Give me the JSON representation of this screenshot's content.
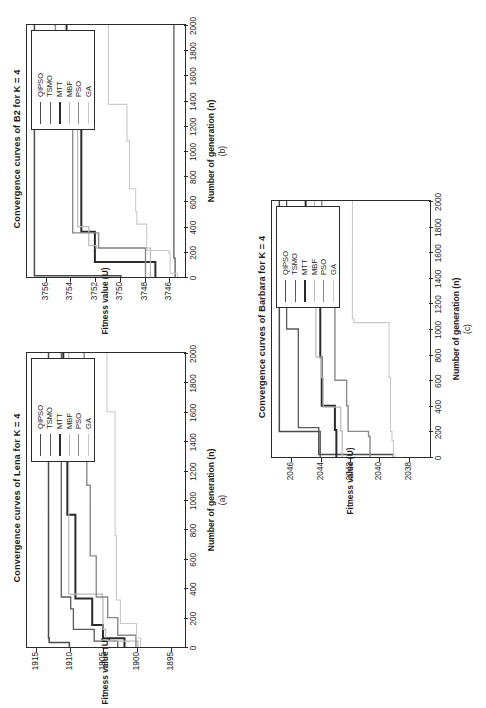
{
  "figure": {
    "orientation_deg": 90,
    "axis_x_label": "Number of generation (n)",
    "axis_y_label": "Fitness value (U)",
    "legend_entries": [
      "QIPSO",
      "TSMO",
      "MTT",
      "MBF",
      "PSO",
      "GA"
    ],
    "series_colors": {
      "QIPSO": "#4a4a4a",
      "TSMO": "#5a5a5a",
      "MTT": "#2b2b2b",
      "MBF": "#b9b9b9",
      "PSO": "#8a8a8a",
      "GA": "#c9c9c9"
    }
  },
  "panels": [
    {
      "id": "a",
      "letter": "(a)",
      "title": "Convergence curves of Lena for K = 4"
    },
    {
      "id": "b",
      "letter": "(b)",
      "title": "Convergence curves of B2 for K = 4"
    },
    {
      "id": "c",
      "letter": "(c)",
      "title": "Convergence curves of Barbara for K = 4"
    }
  ],
  "chart_data": [
    {
      "panel": "a",
      "type": "line",
      "title": "Convergence curves of Lena for K = 4",
      "xlabel": "Number of generation (n)",
      "ylabel": "Fitness value (U)",
      "xlim": [
        0,
        2000
      ],
      "ylim": [
        1893,
        1916.5
      ],
      "xticks": [
        0,
        200,
        400,
        600,
        800,
        1000,
        1200,
        1400,
        1600,
        1800,
        2000
      ],
      "yticks": [
        1915,
        1910,
        1905,
        1900,
        1895
      ],
      "grid": false,
      "legend_position": "upper-right",
      "series": [
        {
          "name": "QIPSO",
          "x": [
            0,
            30,
            60,
            2000
          ],
          "y": [
            1910.2,
            1913.2,
            1913.3,
            1913.3
          ]
        },
        {
          "name": "TSMO",
          "x": [
            0,
            40,
            120,
            260,
            340,
            2000
          ],
          "y": [
            1903.0,
            1906.5,
            1909.6,
            1910.0,
            1911.4,
            1911.4
          ]
        },
        {
          "name": "MTT",
          "x": [
            0,
            60,
            150,
            330,
            900,
            1400,
            2000
          ],
          "y": [
            1902.0,
            1905.2,
            1906.8,
            1909.3,
            1910.5,
            1911.1,
            1911.2
          ]
        },
        {
          "name": "MBF",
          "x": [
            0,
            40,
            120,
            330,
            360,
            2000
          ],
          "y": [
            1900.0,
            1904.8,
            1905.2,
            1905.3,
            1910.3,
            1910.4
          ]
        },
        {
          "name": "PSO",
          "x": [
            0,
            80,
            200,
            340,
            620,
            1100,
            1550,
            2000
          ],
          "y": [
            1900.3,
            1903.0,
            1904.5,
            1906.2,
            1907.1,
            1907.6,
            1908.0,
            1908.1
          ]
        },
        {
          "name": "GA",
          "x": [
            0,
            60,
            160,
            320,
            760,
            1600,
            2000
          ],
          "y": [
            1899.6,
            1900.2,
            1902.6,
            1903.2,
            1903.4,
            1904.6,
            1904.7
          ]
        }
      ]
    },
    {
      "panel": "b",
      "type": "line",
      "title": "Convergence curves of B2 for K = 4",
      "xlabel": "Number of generation (n)",
      "ylabel": "Fitness value (U)",
      "xlim": [
        0,
        2000
      ],
      "ylim": [
        3744.8,
        3757.6
      ],
      "xticks": [
        0,
        200,
        400,
        600,
        800,
        1000,
        1200,
        1400,
        1600,
        1800,
        2000
      ],
      "yticks": [
        3756,
        3754,
        3752,
        3750,
        3748,
        3746
      ],
      "grid": false,
      "legend_position": "upper-right",
      "series": [
        {
          "name": "QIPSO",
          "x": [
            0,
            10,
            2000
          ],
          "y": [
            3750.0,
            3757.0,
            3757.0
          ]
        },
        {
          "name": "TSMO",
          "x": [
            0,
            150,
            2000
          ],
          "y": [
            3745.6,
            3745.7,
            3745.7
          ]
        },
        {
          "name": "MTT",
          "x": [
            0,
            120,
            340,
            360,
            1380,
            2000
          ],
          "y": [
            3747.2,
            3752.1,
            3752.1,
            3753.2,
            3754.4,
            3754.4
          ]
        },
        {
          "name": "MBF",
          "x": [
            0,
            190,
            230,
            250,
            400,
            1400,
            2000
          ],
          "y": [
            3747.6,
            3747.6,
            3752.0,
            3752.6,
            3753.5,
            3754.5,
            3754.5
          ]
        },
        {
          "name": "PSO",
          "x": [
            0,
            200,
            230,
            350,
            1190,
            1400,
            2000
          ],
          "y": [
            3748.0,
            3748.0,
            3751.8,
            3753.9,
            3754.0,
            3755.3,
            3755.4
          ]
        },
        {
          "name": "GA",
          "x": [
            0,
            30,
            190,
            210,
            400,
            420,
            520,
            700,
            1080,
            1370,
            2000
          ],
          "y": [
            3745.4,
            3746.0,
            3746.1,
            3747.9,
            3747.9,
            3748.7,
            3748.8,
            3749.3,
            3749.5,
            3751.0,
            3751.0
          ]
        }
      ]
    },
    {
      "panel": "c",
      "type": "line",
      "title": "Convergence curves of Barbara for K = 4",
      "xlabel": "Number of generation (n)",
      "ylabel": "Fitness value (U)",
      "xlim": [
        0,
        2000
      ],
      "ylim": [
        2036.6,
        2047.4
      ],
      "xticks": [
        0,
        200,
        400,
        600,
        800,
        1000,
        1200,
        1400,
        1600,
        1800,
        2000
      ],
      "yticks": [
        2046,
        2044,
        2042,
        2040,
        2038
      ],
      "grid": false,
      "legend_position": "upper-right",
      "series": [
        {
          "name": "QIPSO",
          "x": [
            0,
            20,
            200,
            2000
          ],
          "y": [
            2039.1,
            2044.2,
            2046.9,
            2046.9
          ]
        },
        {
          "name": "TSMO",
          "x": [
            0,
            200,
            230,
            1000,
            2000
          ],
          "y": [
            2044.1,
            2044.2,
            2045.6,
            2046.4,
            2046.4
          ]
        },
        {
          "name": "MTT",
          "x": [
            0,
            210,
            400,
            780,
            1200,
            2000
          ],
          "y": [
            2043.0,
            2043.1,
            2044.0,
            2044.1,
            2045.1,
            2045.1
          ]
        },
        {
          "name": "MBF",
          "x": [
            0,
            200,
            390,
            620,
            780,
            1220,
            2000
          ],
          "y": [
            2042.6,
            2042.7,
            2043.9,
            2044.0,
            2044.4,
            2044.5,
            2044.5
          ]
        },
        {
          "name": "PSO",
          "x": [
            0,
            160,
            200,
            400,
            600,
            1380,
            2000
          ],
          "y": [
            2040.7,
            2040.8,
            2042.2,
            2042.3,
            2043.1,
            2044.0,
            2044.0
          ]
        },
        {
          "name": "GA",
          "x": [
            0,
            130,
            200,
            620,
            1050,
            1080,
            2000
          ],
          "y": [
            2039.1,
            2039.2,
            2039.3,
            2039.4,
            2041.8,
            2041.9,
            2041.9
          ]
        }
      ]
    }
  ]
}
